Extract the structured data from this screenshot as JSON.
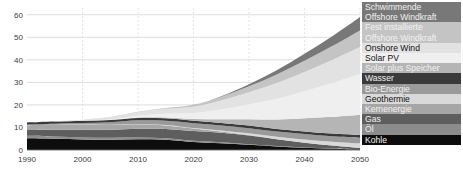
{
  "chart_data": {
    "type": "area",
    "title": "",
    "xlabel": "",
    "ylabel": "",
    "stacked": true,
    "grid": true,
    "legend_position": "right",
    "xlim": [
      1990,
      2050
    ],
    "ylim": [
      0,
      63
    ],
    "yticks": [
      0,
      10,
      20,
      30,
      40,
      50,
      60
    ],
    "xticks": [
      1990,
      2000,
      2010,
      2020,
      2030,
      2040,
      2050
    ],
    "x": [
      1990,
      1995,
      2000,
      2005,
      2010,
      2015,
      2020,
      2025,
      2030,
      2035,
      2040,
      2045,
      2050
    ],
    "series": [
      {
        "name": "Kohle",
        "color": "#0d0d0d",
        "values": [
          5.2,
          5.0,
          4.7,
          4.6,
          4.8,
          4.6,
          3.6,
          3.0,
          2.3,
          1.6,
          1.0,
          0.6,
          0.3
        ]
      },
      {
        "name": "Öl",
        "color": "#8c8c8c",
        "values": [
          1.1,
          1.0,
          0.9,
          0.8,
          0.7,
          0.6,
          0.5,
          0.4,
          0.3,
          0.2,
          0.15,
          0.1,
          0.05
        ]
      },
      {
        "name": "Gas",
        "color": "#5e5e5e",
        "values": [
          2.6,
          3.0,
          3.4,
          3.6,
          3.9,
          4.1,
          4.3,
          4.2,
          3.8,
          3.0,
          2.1,
          1.3,
          0.6
        ]
      },
      {
        "name": "Kernenergie",
        "color": "#a6a6a6",
        "values": [
          2.1,
          2.2,
          2.2,
          2.1,
          2.0,
          1.6,
          1.1,
          0.6,
          0.2,
          0.0,
          0.0,
          0.0,
          0.0
        ]
      },
      {
        "name": "Geothermie",
        "color": "#d9d9d9",
        "values": [
          0.05,
          0.05,
          0.08,
          0.1,
          0.15,
          0.2,
          0.3,
          0.5,
          0.8,
          1.1,
          1.4,
          1.7,
          2.0
        ]
      },
      {
        "name": "Bio-Energie",
        "color": "#9a9a9a",
        "values": [
          0.2,
          0.4,
          0.7,
          1.1,
          1.6,
          1.9,
          2.1,
          2.2,
          2.3,
          2.3,
          2.4,
          2.4,
          2.5
        ]
      },
      {
        "name": "Wasser",
        "color": "#3a3a3a",
        "values": [
          1.0,
          1.0,
          1.0,
          1.0,
          1.05,
          1.05,
          1.1,
          1.1,
          1.15,
          1.15,
          1.2,
          1.2,
          1.2
        ]
      },
      {
        "name": "Solar plus Speicher",
        "color": "#b5b5b5",
        "values": [
          0.0,
          0.0,
          0.0,
          0.05,
          0.2,
          0.4,
          0.8,
          1.6,
          2.8,
          4.2,
          5.8,
          7.4,
          9.0
        ]
      },
      {
        "name": "Solar PV",
        "color": "#efefef",
        "values": [
          0.0,
          0.0,
          0.05,
          0.2,
          0.8,
          1.6,
          2.6,
          4.4,
          6.6,
          9.2,
          12.0,
          15.0,
          18.2
        ]
      },
      {
        "name": "Onshore Wind",
        "color": "#e2e2e2",
        "values": [
          0.0,
          0.1,
          0.4,
          1.0,
          1.6,
          2.2,
          2.8,
          4.0,
          5.4,
          7.0,
          8.6,
          10.2,
          11.8
        ]
      },
      {
        "name": "Fest installierte Offshore Windkraft",
        "color": "#c4c4c4",
        "values": [
          0.0,
          0.0,
          0.0,
          0.05,
          0.15,
          0.4,
          0.8,
          1.6,
          2.6,
          3.8,
          5.0,
          6.2,
          7.4
        ]
      },
      {
        "name": "Schwimmende Offshore Windkraft",
        "color": "#787878",
        "values": [
          0.0,
          0.0,
          0.0,
          0.0,
          0.0,
          0.0,
          0.05,
          0.3,
          0.9,
          1.8,
          3.0,
          4.4,
          6.0
        ]
      }
    ]
  },
  "legend": {
    "items": [
      {
        "label": "Schwimmende\nOffshore Windkraft",
        "color": "#787878",
        "text": "light"
      },
      {
        "label": "Fest installierte\nOffshore Windkraft",
        "color": "#c4c4c4",
        "text": "light"
      },
      {
        "label": "Onshore Wind",
        "color": "#e2e2e2",
        "text": "dark"
      },
      {
        "label": "Solar PV",
        "color": "#efefef",
        "text": "dark"
      },
      {
        "label": "Solar plus Speicher",
        "color": "#b5b5b5",
        "text": "light"
      },
      {
        "label": "Wasser",
        "color": "#3a3a3a",
        "text": "light"
      },
      {
        "label": "Bio-Energie",
        "color": "#9a9a9a",
        "text": "light"
      },
      {
        "label": "Geothermie",
        "color": "#d9d9d9",
        "text": "dark"
      },
      {
        "label": "Kernenergie",
        "color": "#a6a6a6",
        "text": "light"
      },
      {
        "label": "Gas",
        "color": "#5e5e5e",
        "text": "light"
      },
      {
        "label": "Öl",
        "color": "#8c8c8c",
        "text": "light"
      },
      {
        "label": "Kohle",
        "color": "#0d0d0d",
        "text": "light"
      }
    ]
  },
  "axes": {
    "ytick_labels": [
      "60",
      "50",
      "40",
      "30",
      "20",
      "10",
      "0"
    ],
    "xtick_labels": [
      "1990",
      "2000",
      "2010",
      "2020",
      "2030",
      "2040",
      "2050"
    ]
  }
}
